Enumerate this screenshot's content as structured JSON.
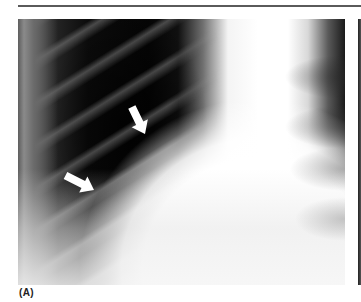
{
  "figure": {
    "panel_label": "(A)",
    "image_description": "Chest radiograph (X-ray) detail with two white arrows pointing to a line in the lung field",
    "arrows": [
      {
        "name": "upper-arrow",
        "tail": [
          113,
          87
        ],
        "tip": [
          127,
          115
        ],
        "color": "#ffffff"
      },
      {
        "name": "lower-arrow",
        "tail": [
          46,
          156
        ],
        "tip": [
          76,
          171
        ],
        "color": "#ffffff"
      }
    ]
  },
  "colors": {
    "rule": "#5a5a5a",
    "background": "#ffffff",
    "label": "#222222",
    "arrow": "#ffffff"
  }
}
